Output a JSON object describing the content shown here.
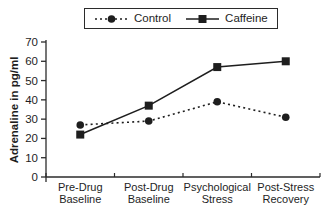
{
  "chart_data": {
    "type": "line",
    "title": "",
    "ylabel": "Adrenaline in pg/ml",
    "xlabel": "",
    "ylim": [
      0,
      70
    ],
    "yticks": [
      0,
      10,
      20,
      30,
      40,
      50,
      60,
      70
    ],
    "grid": false,
    "legend_position": "top-center",
    "categories": [
      "Pre-Drug Baseline",
      "Post-Drug Baseline",
      "Psychological Stress",
      "Post-Stress Recovery"
    ],
    "series": [
      {
        "name": "Control",
        "values": [
          27,
          29,
          39,
          31
        ],
        "marker": "circle",
        "line_style": "dotted",
        "color": "#1e1e1e"
      },
      {
        "name": "Caffeine",
        "values": [
          22,
          37,
          57,
          60
        ],
        "marker": "square",
        "line_style": "solid",
        "color": "#1e1e1e"
      }
    ],
    "colors": {
      "axis": "#2b2b2b",
      "text": "#1e1e1e",
      "background": "#ffffff"
    }
  }
}
